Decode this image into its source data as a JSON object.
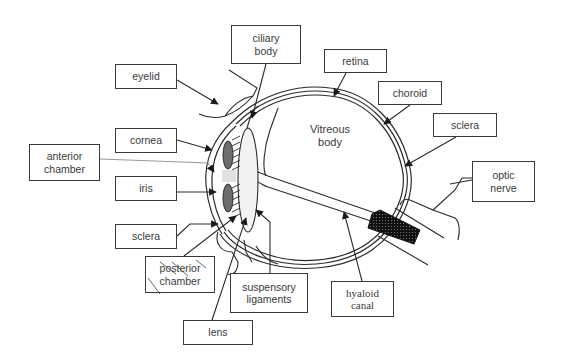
{
  "diagram": {
    "type": "labeled anatomical diagram",
    "center_label": "Vitreous\nbody",
    "labels": {
      "ciliary_body": "ciliary\nbody",
      "eyelid": "eyelid",
      "retina": "retina",
      "choroid": "choroid",
      "cornea": "cornea",
      "sclera_right": "sclera",
      "anterior_chamber": "anterior\nchamber",
      "optic_nerve": "optic\nnerve",
      "iris": "iris",
      "sclera_left": "sclera",
      "posterior_chamber": "posterior\nchamber",
      "suspensory_ligaments": "suspensory\nligaments",
      "hyaloid_canal": "hyaloid\ncanal",
      "lens": "lens"
    },
    "colors": {
      "line": "#2b2b2b",
      "iris_fill": "#6e6e6e",
      "lens_fill": "#f2f2f2",
      "optic_disc_fill": "#111111",
      "background": "#ffffff"
    }
  }
}
